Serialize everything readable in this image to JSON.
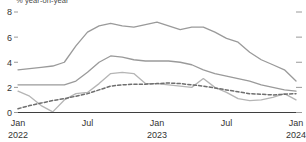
{
  "chart_data": {
    "type": "line",
    "title": "",
    "subtitle": "% year-on-year",
    "xlabel": "",
    "ylabel": "",
    "ylim": [
      0,
      8
    ],
    "yticks": [
      0,
      2,
      4,
      6,
      8
    ],
    "ytick_labels": [
      "0",
      "2",
      "4",
      "6",
      "8"
    ],
    "grid": false,
    "legend_position": "none",
    "x_axis": {
      "ticks": [
        {
          "label": "Jan",
          "sublabel": "2022",
          "x": 0
        },
        {
          "label": "Jul",
          "sublabel": "",
          "x": 6
        },
        {
          "label": "Jan",
          "sublabel": "2023",
          "x": 12
        },
        {
          "label": "Jul",
          "sublabel": "",
          "x": 18
        },
        {
          "label": "Jan",
          "sublabel": "2024",
          "x": 24
        }
      ],
      "xlim": [
        0,
        24
      ]
    },
    "x": [
      0,
      1,
      2,
      3,
      4,
      5,
      6,
      7,
      8,
      9,
      10,
      11,
      12,
      13,
      14,
      15,
      16,
      17,
      18,
      19,
      20,
      21,
      22,
      23,
      24
    ],
    "series": [
      {
        "name": "series-1-upper",
        "style": "solid",
        "color": "#9a9a9a",
        "width": 1.3,
        "values": [
          3.4,
          3.5,
          3.6,
          3.7,
          4.0,
          5.3,
          6.4,
          6.9,
          7.1,
          6.9,
          6.8,
          7.0,
          7.2,
          6.9,
          6.6,
          6.8,
          6.8,
          6.4,
          5.9,
          5.6,
          4.8,
          4.2,
          3.8,
          3.4,
          2.5
        ]
      },
      {
        "name": "series-2-middle",
        "style": "solid",
        "color": "#9a9a9a",
        "width": 1.3,
        "values": [
          2.2,
          2.2,
          2.2,
          2.2,
          2.2,
          2.5,
          3.2,
          4.0,
          4.5,
          4.4,
          4.2,
          4.1,
          4.1,
          4.1,
          4.0,
          3.8,
          3.4,
          3.1,
          2.9,
          2.7,
          2.5,
          2.2,
          2.0,
          1.8,
          1.7
        ]
      },
      {
        "name": "series-3-lower",
        "style": "solid",
        "color": "#b5b5b5",
        "width": 1.3,
        "values": [
          1.7,
          1.3,
          0.55,
          0.05,
          1.0,
          1.5,
          1.6,
          2.3,
          3.1,
          3.2,
          3.1,
          2.3,
          2.3,
          2.2,
          2.1,
          2.0,
          2.7,
          2.0,
          1.6,
          1.1,
          0.95,
          1.0,
          1.2,
          1.5,
          1.0
        ]
      },
      {
        "name": "series-4-dashed",
        "style": "dashed",
        "color": "#6e6e6e",
        "width": 1.5,
        "values": [
          0.3,
          0.55,
          0.75,
          0.95,
          1.1,
          1.3,
          1.5,
          1.8,
          2.1,
          2.2,
          2.25,
          2.25,
          2.3,
          2.35,
          2.3,
          2.2,
          2.1,
          1.95,
          1.8,
          1.65,
          1.5,
          1.45,
          1.4,
          1.45,
          1.5
        ]
      }
    ]
  },
  "colors": {
    "axis": "#3f3f3f",
    "tick": "#9a9a9a",
    "text": "#333333",
    "subtitle": "#4a4a4a"
  }
}
